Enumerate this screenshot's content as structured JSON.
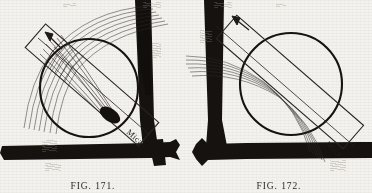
{
  "page": {
    "background_color": "#f4f2ee",
    "ink_color": "#151210",
    "paper_tone": "#e9e5dd",
    "width": 372,
    "height": 193
  },
  "figures": [
    {
      "id": "fig-171",
      "caption": "FIG. 171.",
      "label_mica": "Mica",
      "description": "Converging beam focused to a point on the mica strip",
      "side": "left",
      "lens": {
        "cx": 89,
        "cy": 88,
        "r": 49,
        "stroke": "#151210",
        "stroke_width": 2.0
      },
      "mica_strip": {
        "angle_deg": 41,
        "cx": 92,
        "cy": 85,
        "length": 150,
        "width": 31,
        "stroke": "#2a2622"
      },
      "beam": {
        "kind": "converging",
        "ray_count": 15,
        "focus_x": 111,
        "focus_y": 116,
        "stroke": "#2e2a26"
      },
      "focal_spot": {
        "cx": 111,
        "cy": 116,
        "rx": 11,
        "ry": 6.5,
        "rot_deg": 30,
        "fill": "#17130f"
      },
      "arrow": {
        "x1": 60,
        "y1": 47,
        "x2": 45,
        "y2": 33
      },
      "frame": {
        "post": {
          "type": "vertical",
          "x_top": 137,
          "x_bottom": 150,
          "top_w": 14,
          "bottom_w": 17
        },
        "base": {
          "type": "horizontal",
          "y": 147,
          "height": 13
        }
      }
    },
    {
      "id": "fig-172",
      "caption": "FIG. 172.",
      "label_mica": "Mica",
      "description": "Beam passing obliquely through mica without focus",
      "side": "right",
      "lens": {
        "cx": 105,
        "cy": 84,
        "r": 51,
        "stroke": "#151210",
        "stroke_width": 2.0
      },
      "mica_strip": {
        "angle_deg": 41,
        "cx": 104,
        "cy": 82,
        "length": 168,
        "width": 31,
        "stroke": "#2a2622"
      },
      "beam": {
        "kind": "curved-parallel",
        "ray_count": 15,
        "stroke": "#2e2a26"
      },
      "arrow": {
        "x1": 48,
        "y1": 44,
        "x2": 34,
        "y2": 31
      },
      "frame": {
        "post": {
          "type": "vertical",
          "x_top": 22,
          "x_bottom": 24,
          "top_w": 15,
          "bottom_w": 17
        },
        "base": {
          "type": "horizontal",
          "y": 146,
          "height": 13
        }
      }
    }
  ],
  "artifacts": {
    "description": "faint show-through smudges from the reverse of the scanned page",
    "marks": [
      {
        "x": 42,
        "y": 140,
        "w": 15,
        "h": 12
      },
      {
        "x": 45,
        "y": 163,
        "w": 16,
        "h": 8
      },
      {
        "x": 152,
        "y": 42,
        "w": 9,
        "h": 16
      },
      {
        "x": 200,
        "y": 30,
        "w": 12,
        "h": 13
      },
      {
        "x": 330,
        "y": 160,
        "w": 16,
        "h": 11
      },
      {
        "x": 143,
        "y": 2,
        "w": 18,
        "h": 6
      },
      {
        "x": 214,
        "y": 2,
        "w": 18,
        "h": 6
      },
      {
        "x": 276,
        "y": 3,
        "w": 10,
        "h": 4
      },
      {
        "x": 63,
        "y": 3,
        "w": 13,
        "h": 4
      }
    ]
  }
}
